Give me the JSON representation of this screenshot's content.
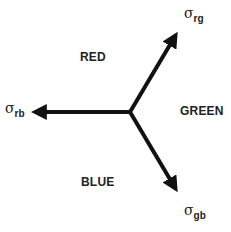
{
  "diagram": {
    "regions": [
      {
        "label": "RED"
      },
      {
        "label": "GREEN"
      },
      {
        "label": "BLUE"
      }
    ],
    "arrows": [
      {
        "symbol": "σ",
        "subscript": "rg"
      },
      {
        "symbol": "σ",
        "subscript": "rb"
      },
      {
        "symbol": "σ",
        "subscript": "gb"
      }
    ]
  }
}
